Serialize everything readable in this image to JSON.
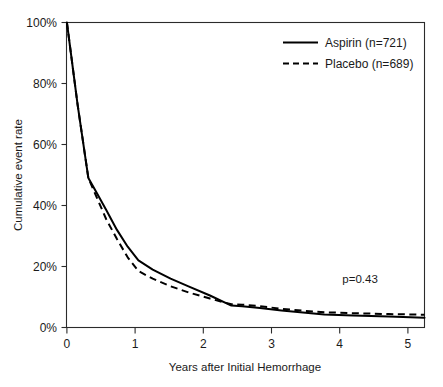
{
  "chart_data": {
    "type": "line",
    "title": "",
    "subtitle": "",
    "xlabel": "Years after Initial Hemorrhage",
    "ylabel": "Cumulative event rate",
    "xlim": [
      0,
      5
    ],
    "ylim": [
      0,
      100
    ],
    "grid": false,
    "legend_position": "top-right",
    "x_ticks": [
      0,
      1,
      2,
      3,
      4,
      5
    ],
    "x_tick_labels": [
      "0",
      "1",
      "2",
      "3",
      "4",
      "5"
    ],
    "y_ticks": [
      0,
      20,
      40,
      60,
      80,
      100
    ],
    "y_tick_labels": [
      "0%",
      "20%",
      "40%",
      "60%",
      "80%",
      "100%"
    ],
    "annotations": [
      {
        "text": "p=0.43",
        "x": 4.1,
        "y": 14.5
      }
    ],
    "series": [
      {
        "name": "Aspirin (n=721)",
        "style": "solid",
        "color": "#000000",
        "x": [
          0.0,
          0.15,
          0.3,
          0.42,
          0.55,
          0.7,
          0.85,
          1.0,
          1.2,
          1.45,
          1.7,
          2.0,
          2.3,
          2.45,
          2.7,
          3.0,
          3.3,
          3.6,
          4.0,
          4.5,
          5.0
        ],
        "y": [
          100.0,
          73.0,
          49.0,
          44.0,
          38.5,
          32.0,
          26.5,
          22.0,
          19.0,
          16.0,
          13.5,
          10.5,
          7.2,
          7.0,
          6.4,
          5.6,
          4.9,
          4.3,
          3.9,
          3.6,
          3.2
        ]
      },
      {
        "name": "Placebo (n=689)",
        "style": "dashed",
        "color": "#000000",
        "x": [
          0.0,
          0.15,
          0.3,
          0.42,
          0.55,
          0.7,
          0.85,
          1.0,
          1.2,
          1.45,
          1.7,
          2.0,
          2.3,
          2.45,
          2.7,
          3.0,
          3.3,
          3.6,
          4.0,
          4.5,
          5.0
        ],
        "y": [
          100.0,
          73.0,
          49.0,
          42.5,
          35.5,
          29.0,
          23.0,
          18.5,
          16.0,
          13.5,
          11.5,
          9.5,
          7.6,
          7.5,
          7.0,
          6.1,
          5.5,
          5.0,
          4.7,
          4.4,
          4.2
        ]
      }
    ]
  },
  "legend": {
    "entries": [
      {
        "label": "Aspirin (n=721)",
        "style": "solid"
      },
      {
        "label": "Placebo (n=689)",
        "style": "dashed"
      }
    ]
  },
  "axes": {
    "x_title": "Years after Initial Hemorrhage",
    "y_title": "Cumulative event rate"
  },
  "statistics": {
    "p_value_label": "p=0.43"
  }
}
